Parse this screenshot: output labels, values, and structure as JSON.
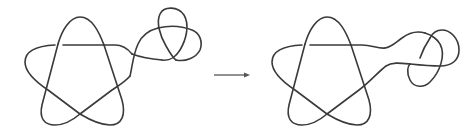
{
  "figure": {
    "left_diagram": {
      "label": "",
      "description": "Cinquefoil-like pentagram knot connected to a trefoil via a tangled bridge"
    },
    "arrow": {
      "direction": "right",
      "label": ""
    },
    "right_diagram": {
      "label": "",
      "description": "Same pentagram knot connected to a trefoil via a smoothed bridge"
    }
  },
  "colors": {
    "stroke": "#3a3a3a",
    "background": "#ffffff",
    "arrow": "#555555"
  }
}
